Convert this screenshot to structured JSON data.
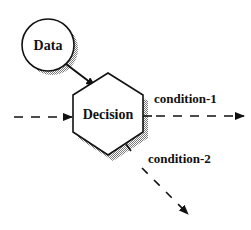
{
  "diagram": {
    "type": "flow",
    "nodes": [
      {
        "id": "data",
        "shape": "circle",
        "label": "Data"
      },
      {
        "id": "decision",
        "shape": "hexagon",
        "label": "Decision"
      }
    ],
    "edges": [
      {
        "from": "data",
        "to": "decision",
        "style": "solid",
        "label": ""
      },
      {
        "from": "external-input",
        "to": "decision",
        "style": "dashed",
        "label": ""
      },
      {
        "from": "decision",
        "to": "output-1",
        "style": "dashed",
        "label": "condition-1"
      },
      {
        "from": "decision",
        "to": "output-2",
        "style": "dashed",
        "label": "condition-2"
      }
    ]
  },
  "labels": {
    "data": "Data",
    "decision": "Decision",
    "condition1": "condition-1",
    "condition2": "condition-2"
  },
  "colors": {
    "stroke": "#111111",
    "shadow": "#9a9a9a",
    "background": "#ffffff"
  }
}
